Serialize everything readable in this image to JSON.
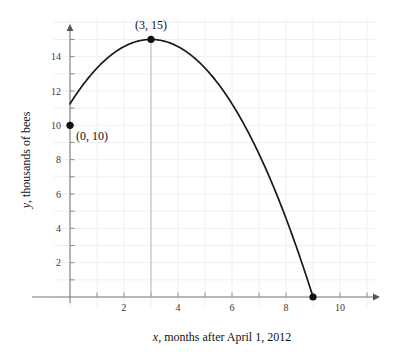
{
  "chart_data": {
    "type": "line",
    "title": "",
    "subtitle": "",
    "xlabel": "x, months after April 1, 2012",
    "ylabel": "y, thousands of bees",
    "xlabel_var": "x",
    "xlabel_rest": ", months after April 1, 2012",
    "ylabel_var": "y",
    "ylabel_rest": ", thousands of bees",
    "xlim": [
      -0.6,
      11.3
    ],
    "ylim": [
      -0.6,
      16.2
    ],
    "grid": true,
    "grid_spacing_x": 1,
    "grid_spacing_y": 1,
    "legend": "none",
    "xticks": [
      2,
      4,
      6,
      8,
      10
    ],
    "xtick_labels": [
      "2",
      "4",
      "6",
      "8",
      "10"
    ],
    "yticks": [
      2,
      4,
      6,
      8,
      10,
      12,
      14
    ],
    "ytick_labels": [
      "2",
      "4",
      "6",
      "8",
      "10",
      "12",
      "14"
    ],
    "minor_xticks": [
      1,
      3,
      5,
      7,
      9,
      11
    ],
    "curve": {
      "name": "bee population",
      "equation": "y = -(5/9)(x - 3)^2 + 15",
      "vertex": [
        3,
        15
      ],
      "x_start": 0,
      "x_end": 9,
      "color": "#1a1a1a",
      "x": [
        0,
        0.5,
        1,
        1.5,
        2,
        2.5,
        3,
        3.5,
        4,
        4.5,
        5,
        5.5,
        6,
        6.5,
        7,
        7.5,
        8,
        8.5,
        9
      ],
      "y": [
        10,
        11.53,
        12.78,
        13.75,
        14.44,
        14.86,
        15,
        14.86,
        14.44,
        13.75,
        12.78,
        11.53,
        10,
        8.19,
        6.11,
        3.75,
        1.11,
        -1.81,
        0
      ]
    },
    "points": [
      {
        "name": "y-intercept",
        "x": 0,
        "y": 10,
        "label": "(0, 10)",
        "label_position": "below-right",
        "marker": "filled-circle"
      },
      {
        "name": "vertex-maximum",
        "x": 3,
        "y": 15,
        "label": "(3, 15)",
        "label_position": "above",
        "marker": "filled-circle"
      },
      {
        "name": "x-intercept",
        "x": 9,
        "y": 0,
        "label": "",
        "label_position": "none",
        "marker": "filled-circle"
      }
    ],
    "guide_lines": [
      {
        "name": "vertex-dropline",
        "from": [
          3,
          15
        ],
        "to": [
          3,
          0
        ],
        "color": "#b8b8b8"
      }
    ],
    "axis_arrows": {
      "x": "right",
      "y": "up"
    },
    "colors": {
      "curve": "#1a1a1a",
      "axis": "#7a7a7a",
      "grid": "#f0f0f0",
      "point": "#111111",
      "guide": "#b8b8b8",
      "text": "#1a1a1a"
    }
  }
}
